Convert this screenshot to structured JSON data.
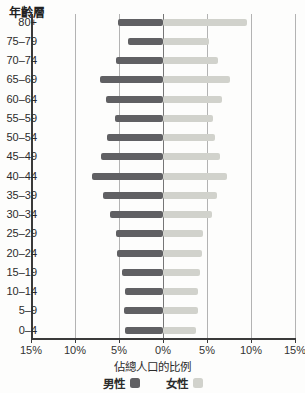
{
  "title": "年齡層",
  "xlabel": "佔總人口的比例",
  "legend": {
    "male": "男性",
    "female": "女性"
  },
  "colors": {
    "male_bar": "#606063",
    "female_bar": "#d1d2cc",
    "grid_light": "#b3b3b3",
    "zero_line": "#767676",
    "axis": "#3a3a3a"
  },
  "chart_data": {
    "type": "bar",
    "subtype": "population-pyramid",
    "title": "年齡層",
    "xlabel": "佔總人口的比例",
    "categories_top_to_bottom": [
      "80+",
      "75–79",
      "70–74",
      "65–69",
      "60–64",
      "55–59",
      "50–54",
      "45–49",
      "40–44",
      "35–39",
      "30–34",
      "25–29",
      "20–24",
      "15–19",
      "10–14",
      "5–9",
      "0–4"
    ],
    "series": [
      {
        "name": "男性",
        "side": "left",
        "values_percent": [
          5.1,
          4.0,
          5.3,
          7.2,
          6.5,
          5.4,
          6.4,
          7.0,
          8.1,
          6.8,
          6.0,
          5.3,
          5.2,
          4.7,
          4.3,
          4.4,
          4.3
        ]
      },
      {
        "name": "女性",
        "side": "right",
        "values_percent": [
          9.6,
          5.2,
          6.3,
          7.6,
          6.7,
          5.7,
          5.9,
          6.5,
          7.3,
          6.1,
          5.6,
          4.5,
          4.4,
          4.2,
          4.0,
          4.0,
          3.8
        ]
      }
    ],
    "x_tick_labels": [
      "15%",
      "10%",
      "5%",
      "0%",
      "5%",
      "10%",
      "15%"
    ],
    "xlim_percent": [
      -15,
      15
    ],
    "x_tick_step_percent": 5,
    "grid": true,
    "legend_position": "bottom"
  }
}
